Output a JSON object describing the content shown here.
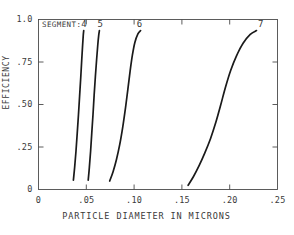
{
  "chart_data": {
    "type": "line",
    "title": "",
    "xlabel": "PARTICLE DIAMETER IN MICRONS",
    "ylabel": "EFFICIENCY",
    "xlim": [
      0,
      0.25
    ],
    "ylim": [
      0,
      1.0
    ],
    "xticks": [
      0,
      0.05,
      0.1,
      0.15,
      0.2,
      0.25
    ],
    "xtick_labels": [
      "0",
      ".05",
      ".10",
      ".15",
      ".20",
      ".25"
    ],
    "yticks": [
      0,
      0.25,
      0.5,
      0.75,
      1.0
    ],
    "ytick_labels": [
      "0",
      ".25",
      ".50",
      ".75",
      "1.0"
    ],
    "grid": false,
    "legend_position": "inside-top-left",
    "legend_title": "SEGMENT:",
    "line_color": "#1a1a1a",
    "series": [
      {
        "name": "4",
        "label": "4",
        "label_x": 0.0475,
        "label_y": 0.995,
        "points": [
          [
            0.0365,
            0.055
          ],
          [
            0.0378,
            0.13
          ],
          [
            0.0392,
            0.225
          ],
          [
            0.0405,
            0.33
          ],
          [
            0.0418,
            0.44
          ],
          [
            0.043,
            0.55
          ],
          [
            0.0442,
            0.66
          ],
          [
            0.0452,
            0.76
          ],
          [
            0.0461,
            0.845
          ],
          [
            0.0468,
            0.905
          ],
          [
            0.0473,
            0.935
          ]
        ]
      },
      {
        "name": "5",
        "label": "5",
        "label_x": 0.0645,
        "label_y": 0.995,
        "points": [
          [
            0.052,
            0.055
          ],
          [
            0.0532,
            0.13
          ],
          [
            0.0545,
            0.225
          ],
          [
            0.0557,
            0.33
          ],
          [
            0.057,
            0.44
          ],
          [
            0.0582,
            0.555
          ],
          [
            0.0595,
            0.665
          ],
          [
            0.0608,
            0.765
          ],
          [
            0.062,
            0.85
          ],
          [
            0.063,
            0.908
          ],
          [
            0.0637,
            0.935
          ]
        ]
      },
      {
        "name": "6",
        "label": "6",
        "label_x": 0.1055,
        "label_y": 0.995,
        "points": [
          [
            0.0745,
            0.05
          ],
          [
            0.078,
            0.105
          ],
          [
            0.0815,
            0.175
          ],
          [
            0.085,
            0.265
          ],
          [
            0.0882,
            0.37
          ],
          [
            0.091,
            0.48
          ],
          [
            0.0935,
            0.59
          ],
          [
            0.0958,
            0.695
          ],
          [
            0.0982,
            0.79
          ],
          [
            0.1008,
            0.865
          ],
          [
            0.104,
            0.915
          ],
          [
            0.1068,
            0.935
          ]
        ]
      },
      {
        "name": "7",
        "label": "7",
        "label_x": 0.2325,
        "label_y": 0.995,
        "points": [
          [
            0.1565,
            0.025
          ],
          [
            0.162,
            0.075
          ],
          [
            0.168,
            0.14
          ],
          [
            0.174,
            0.215
          ],
          [
            0.18,
            0.3
          ],
          [
            0.1855,
            0.395
          ],
          [
            0.1905,
            0.495
          ],
          [
            0.1955,
            0.6
          ],
          [
            0.201,
            0.7
          ],
          [
            0.207,
            0.785
          ],
          [
            0.214,
            0.86
          ],
          [
            0.2215,
            0.912
          ],
          [
            0.228,
            0.935
          ]
        ]
      }
    ]
  }
}
